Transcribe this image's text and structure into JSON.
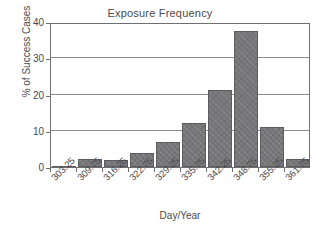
{
  "chart_data": {
    "type": "bar",
    "title": "Exposure Frequency",
    "xlabel": "Day/Year",
    "ylabel": "% of Success Cases",
    "categories": [
      "303.25",
      "309.75",
      "316.25",
      "322.75",
      "329.25",
      "335.75",
      "342.25",
      "348.75",
      "355.25",
      "361.75"
    ],
    "values": [
      0.3,
      2.1,
      2.0,
      3.8,
      7.0,
      12.1,
      21.2,
      37.5,
      11.1,
      2.2
    ],
    "ylim": [
      0,
      40
    ],
    "yticks": [
      "0",
      "10",
      "20",
      "30",
      "40"
    ],
    "ytick_values": [
      0,
      10,
      20,
      30,
      40
    ],
    "grid": "horizontal",
    "legend": "none",
    "bar_color": "#77777a",
    "bar_edge_color": "#5c5c60",
    "axis_color": "#6f6f6f",
    "text_color": "#4a4a4a"
  }
}
